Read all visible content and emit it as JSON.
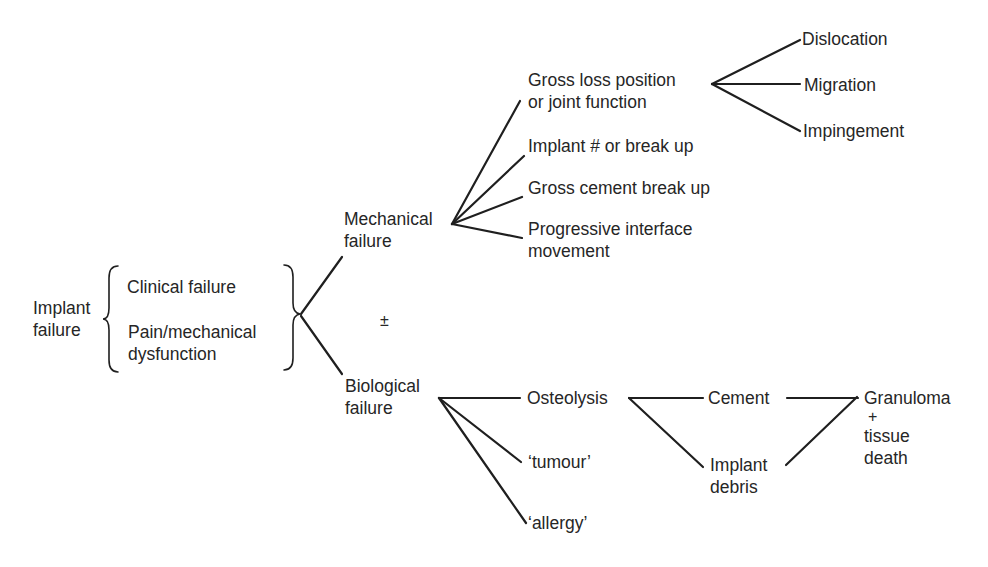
{
  "diagram": {
    "root": {
      "lines": [
        "Implant",
        "failure"
      ]
    },
    "criteria": [
      {
        "lines": [
          "Clinical failure"
        ]
      },
      {
        "lines": [
          "Pain/mechanical",
          "dysfunction"
        ]
      }
    ],
    "plus_minus": "±",
    "mechanical": {
      "lines": [
        "Mechanical",
        "failure"
      ],
      "children": [
        {
          "lines": [
            "Gross loss position",
            "or joint function"
          ]
        },
        {
          "lines": [
            "Implant # or break up"
          ]
        },
        {
          "lines": [
            "Gross cement break up"
          ]
        },
        {
          "lines": [
            "Progressive interface",
            "movement"
          ]
        }
      ],
      "gross_loss_children": [
        {
          "label": "Dislocation"
        },
        {
          "label": "Migration"
        },
        {
          "label": "Impingement"
        }
      ]
    },
    "biological": {
      "lines": [
        "Biological",
        "failure"
      ],
      "children": [
        {
          "lines": [
            "Osteolysis"
          ]
        },
        {
          "lines": [
            "‘tumour’"
          ]
        },
        {
          "lines": [
            "‘allergy’"
          ]
        }
      ],
      "osteolysis_children": [
        {
          "lines": [
            "Cement"
          ]
        },
        {
          "lines": [
            "Implant",
            "debris"
          ]
        }
      ],
      "outcome": {
        "lines": [
          "Granuloma",
          "+",
          "tissue",
          "death"
        ]
      }
    },
    "colors": {
      "ink": "#262626",
      "background": "#ffffff"
    }
  }
}
